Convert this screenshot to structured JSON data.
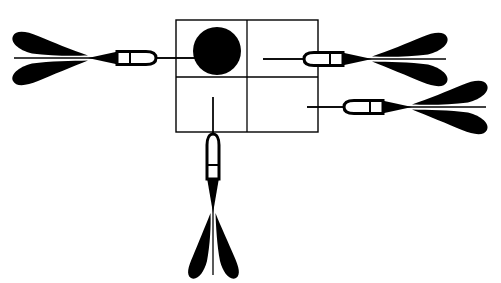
{
  "figure": {
    "background_color": "#ffffff",
    "ink_color": "#000000",
    "width": 501,
    "height": 283
  },
  "target": {
    "name": "quartered-square-target",
    "shape": "square",
    "x": 176,
    "y": 20,
    "width": 142,
    "height": 112,
    "stroke_color": "#000000",
    "stroke_width": 1.4,
    "fill": "none",
    "divider_vertical_x": 247,
    "divider_horizontal_y": 77,
    "cells": [
      {
        "label": "top-left",
        "has_circle": true
      },
      {
        "label": "top-right",
        "has_circle": false
      },
      {
        "label": "bottom-left",
        "has_circle": false
      },
      {
        "label": "bottom-right",
        "has_circle": false
      }
    ]
  },
  "bullseye": {
    "name": "filled-circle",
    "cx": 217,
    "cy": 51,
    "r": 24,
    "fill_color": "#000000"
  },
  "darts": [
    {
      "id": "dart-left",
      "direction": "right",
      "orientation": "horizontal",
      "axis_y": 58,
      "tip_x": 196,
      "barrel_front_x": 155,
      "barrel_back_x": 116,
      "taper_x": 88,
      "fletch_tip_x": 88,
      "fletch_back_x": 14,
      "fletch_half_height": 22,
      "barrel_half_height": 7
    },
    {
      "id": "dart-right-upper",
      "direction": "left",
      "orientation": "horizontal",
      "axis_y": 59,
      "tip_x": 263,
      "barrel_front_x": 305,
      "barrel_back_x": 344,
      "taper_x": 372,
      "fletch_tip_x": 372,
      "fletch_back_x": 446,
      "fletch_half_height": 22,
      "barrel_half_height": 7
    },
    {
      "id": "dart-right-lower",
      "direction": "left",
      "orientation": "horizontal",
      "axis_y": 107,
      "tip_x": 307,
      "barrel_front_x": 345,
      "barrel_back_x": 384,
      "taper_x": 412,
      "fletch_tip_x": 412,
      "fletch_back_x": 486,
      "fletch_half_height": 22,
      "barrel_half_height": 7
    },
    {
      "id": "dart-bottom",
      "direction": "up",
      "orientation": "vertical",
      "axis_x": 213,
      "tip_y": 97,
      "barrel_front_y": 133,
      "barrel_back_y": 180,
      "taper_y": 213,
      "fletch_tip_y": 213,
      "fletch_back_y": 275,
      "fletch_half_width": 22,
      "barrel_half_width": 7
    }
  ],
  "guide_lines": [
    {
      "name": "left-dart-shaft-line",
      "x1": 14,
      "y1": 58,
      "x2": 196,
      "y2": 58
    },
    {
      "name": "right-upper-dart-shaft-line",
      "x1": 263,
      "y1": 59,
      "x2": 446,
      "y2": 59
    },
    {
      "name": "right-lower-dart-shaft-line",
      "x1": 307,
      "y1": 107,
      "x2": 486,
      "y2": 107
    },
    {
      "name": "bottom-dart-shaft-line",
      "x1": 213,
      "y1": 97,
      "x2": 213,
      "y2": 275
    }
  ]
}
